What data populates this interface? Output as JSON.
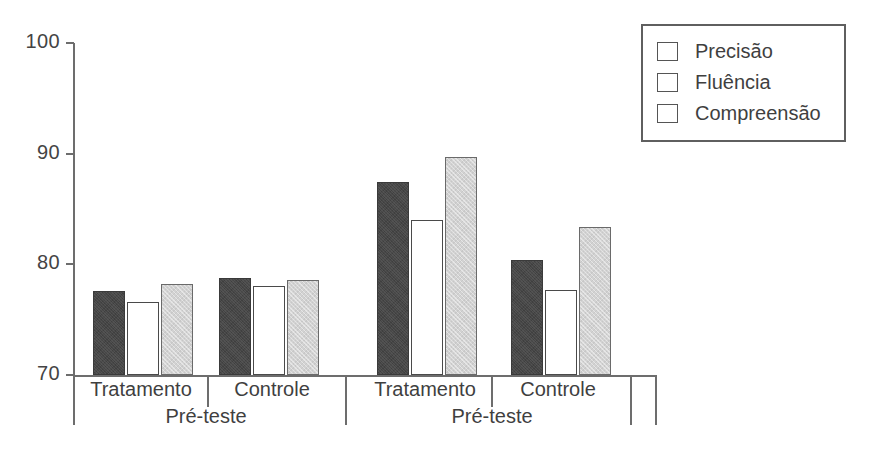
{
  "chart_data": {
    "type": "bar",
    "title": "",
    "subtitle": "",
    "xlabel": "",
    "ylabel": "",
    "ylim": [
      70,
      100
    ],
    "yticks": [
      70,
      80,
      90,
      100
    ],
    "ytick_labels": [
      "70",
      "80",
      "90",
      "100"
    ],
    "grid": false,
    "legend_position": "top-right",
    "categories": [
      "Tratamento",
      "Controle",
      "Tratamento",
      "Controle"
    ],
    "supercategories": [
      "Pré-teste",
      "Pré-teste"
    ],
    "bar_order": [
      "Fluência",
      "Precisão",
      "Compreensão"
    ],
    "series": [
      {
        "name": "Precisão",
        "color": "#ffffff",
        "values": [
          76.6,
          78.0,
          84.0,
          77.7
        ]
      },
      {
        "name": "Fluência",
        "color": "#464646",
        "values": [
          77.6,
          78.8,
          87.4,
          80.4
        ]
      },
      {
        "name": "Compreensão",
        "color": "#d2d2d2",
        "values": [
          78.2,
          78.6,
          89.7,
          83.4
        ]
      }
    ],
    "groups": [
      {
        "category": "Tratamento",
        "supercategory": "Pré-teste",
        "bars": [
          {
            "series": "Fluência",
            "value": 77.6
          },
          {
            "series": "Precisão",
            "value": 76.6
          },
          {
            "series": "Compreensão",
            "value": 78.2
          }
        ]
      },
      {
        "category": "Controle",
        "supercategory": "Pré-teste",
        "bars": [
          {
            "series": "Fluência",
            "value": 78.8
          },
          {
            "series": "Precisão",
            "value": 78.0
          },
          {
            "series": "Compreensão",
            "value": 78.6
          }
        ]
      },
      {
        "category": "Tratamento",
        "supercategory": "Pré-teste",
        "bars": [
          {
            "series": "Fluência",
            "value": 87.4
          },
          {
            "series": "Precisão",
            "value": 84.0
          },
          {
            "series": "Compreensão",
            "value": 89.7
          }
        ]
      },
      {
        "category": "Controle",
        "supercategory": "Pré-teste",
        "bars": [
          {
            "series": "Fluência",
            "value": 80.4
          },
          {
            "series": "Precisão",
            "value": 77.7
          },
          {
            "series": "Compreensão",
            "value": 83.4
          }
        ]
      }
    ]
  },
  "axis": {
    "y_ticks": [
      {
        "label": "100",
        "value": 100
      },
      {
        "label": "90",
        "value": 90
      },
      {
        "label": "80",
        "value": 80
      },
      {
        "label": "70",
        "value": 70
      }
    ]
  },
  "legend": {
    "items": [
      {
        "label": "Precisão",
        "color": "#ffffff",
        "fill": "white"
      },
      {
        "label": "Fluência",
        "color": "#464646",
        "fill": "dark"
      },
      {
        "label": "Compreensão",
        "color": "#d2d2d2",
        "fill": "light"
      }
    ]
  },
  "colors": {
    "axis": "#6d6d6d",
    "text": "#3f3f3f",
    "bar_dark": "#464646",
    "bar_white": "#ffffff",
    "bar_light": "#d2d2d2",
    "border": "#555555",
    "background": "#ffffff"
  }
}
